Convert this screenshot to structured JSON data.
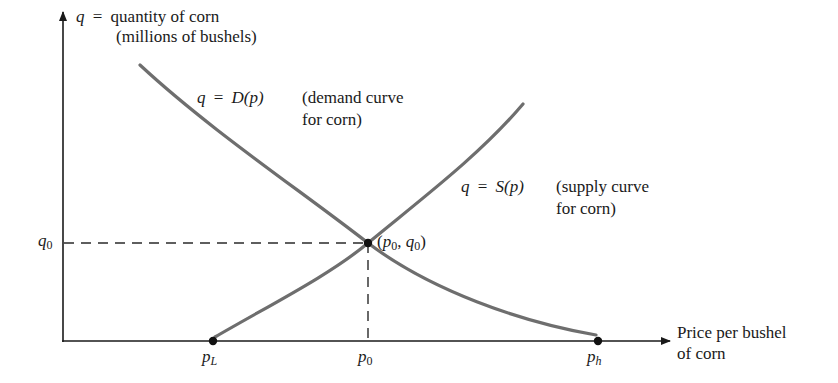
{
  "diagram": {
    "type": "supply-demand-equilibrium",
    "colors": {
      "axis": "#1a1a1a",
      "curve": "#6e6e6e",
      "dashed": "#2a2a2a",
      "point": "#111111",
      "background": "#ffffff"
    },
    "y_axis": {
      "variable": "q",
      "equals": "=",
      "label_line1": "quantity of corn",
      "label_line2": "(millions of bushels)"
    },
    "x_axis": {
      "label_line1": "Price per bushel",
      "label_line2": "of corn"
    },
    "demand_curve": {
      "equation_lhs": "q",
      "equals": "=",
      "equation_rhs": "D(p)",
      "description_line1": "(demand curve",
      "description_line2": "for corn)"
    },
    "supply_curve": {
      "equation_lhs": "q",
      "equals": "=",
      "equation_rhs": "S(p)",
      "description_line1": "(supply curve",
      "description_line2": "for corn)"
    },
    "equilibrium": {
      "label_open": "(",
      "p_symbol": "p",
      "p_sub": "0",
      "comma": ", ",
      "q_symbol": "q",
      "q_sub": "0",
      "label_close": ")"
    },
    "ticks": {
      "q0": {
        "symbol": "q",
        "sub": "0"
      },
      "pL": {
        "symbol": "p",
        "sub": "L"
      },
      "p0": {
        "symbol": "p",
        "sub": "0"
      },
      "ph": {
        "symbol": "p",
        "sub": "h"
      }
    }
  }
}
